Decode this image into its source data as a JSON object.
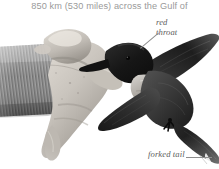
{
  "page": {
    "width": 219,
    "height": 169,
    "background_color": "#ffffff"
  },
  "caption": {
    "text": "850 km (530 miles) across the Gulf of",
    "color": "#9a9a9a"
  },
  "photo": {
    "subject": "hand holding a ruby-throated hummingbird in flight pose",
    "type": "grayscale-photograph",
    "description": "A person's hand in a ribbed knit sleeve holds a small dark hummingbird with outstretched wings and a forked tail",
    "palette": {
      "background": "#ffffff",
      "sleeve_dark": "#6f6f6f",
      "sleeve_mid": "#8f8f8f",
      "sleeve_light": "#b4b4b4",
      "hand_light": "#d5d2cd",
      "hand_mid": "#b6b2ac",
      "hand_shadow": "#8e8a85",
      "bird_darkest": "#151515",
      "bird_dark": "#2c2c2c",
      "bird_mid": "#4a4a4a",
      "bird_light": "#8a8a8a",
      "throat_pale": "#c8c5c0"
    }
  },
  "annotations": [
    {
      "id": "red-throat",
      "lines": [
        "red",
        "throat"
      ],
      "style": "italic",
      "color": "#5d5d5d",
      "leader_color": "#8d8d8d"
    },
    {
      "id": "forked-tail",
      "lines": [
        "forked tail"
      ],
      "style": "italic",
      "color": "#5d5d5d",
      "leader_color": "#8d8d8d"
    }
  ]
}
